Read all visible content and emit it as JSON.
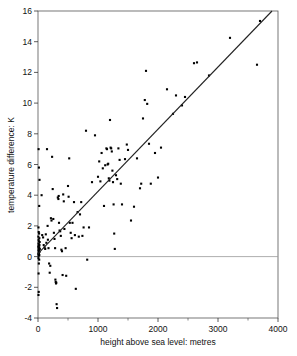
{
  "chart_data": {
    "type": "scatter",
    "title": "",
    "subtitle": "",
    "xlabel": "height above sea level: metres",
    "ylabel": "temperature difference: K",
    "xlim": [
      0,
      4000
    ],
    "ylim": [
      -4,
      16
    ],
    "xticks": [
      0,
      1000,
      2000,
      3000,
      4000
    ],
    "xtick_labels": [
      "0",
      "1000",
      "2000",
      "3000",
      "4000"
    ],
    "xminor_ticks": [
      500,
      1500,
      2500,
      3500
    ],
    "yticks": [
      -4,
      -2,
      0,
      2,
      4,
      6,
      8,
      10,
      12,
      14,
      16
    ],
    "ytick_labels": [
      "-4",
      "-2",
      "0",
      "2",
      "4",
      "6",
      "8",
      "10",
      "12",
      "14",
      "16"
    ],
    "grid": false,
    "zero_line": {
      "y": 0,
      "color": "#999999",
      "visible": true
    },
    "legend": null,
    "marker": {
      "shape": "square",
      "size": 2.1,
      "color": "#000000"
    },
    "trendline": {
      "type": "line",
      "color": "#222222",
      "x_start": 0,
      "y_start": 0.2,
      "x_end": 3900,
      "y_end": 16.0,
      "slope": 0.004051,
      "intercept": 0.2
    },
    "series": [
      {
        "name": "stations",
        "points": [
          [
            10,
            7.0
          ],
          [
            15,
            5.8
          ],
          [
            20,
            3.3
          ],
          [
            25,
            5.0
          ],
          [
            8,
            1.9
          ],
          [
            12,
            1.6
          ],
          [
            18,
            1.5
          ],
          [
            6,
            1.3
          ],
          [
            22,
            1.2
          ],
          [
            10,
            1.1
          ],
          [
            14,
            1.0
          ],
          [
            28,
            0.95
          ],
          [
            8,
            0.85
          ],
          [
            16,
            0.8
          ],
          [
            24,
            0.75
          ],
          [
            12,
            0.7
          ],
          [
            6,
            0.65
          ],
          [
            20,
            0.6
          ],
          [
            10,
            0.55
          ],
          [
            30,
            0.5
          ],
          [
            14,
            0.45
          ],
          [
            8,
            0.4
          ],
          [
            18,
            0.35
          ],
          [
            24,
            0.3
          ],
          [
            10,
            0.25
          ],
          [
            16,
            0.2
          ],
          [
            6,
            0.15
          ],
          [
            22,
            0.1
          ],
          [
            12,
            0.05
          ],
          [
            8,
            -0.1
          ],
          [
            20,
            -0.2
          ],
          [
            14,
            -0.45
          ],
          [
            10,
            -1.1
          ],
          [
            12,
            -2.3
          ],
          [
            8,
            -2.5
          ],
          [
            60,
            4.0
          ],
          [
            70,
            1.4
          ],
          [
            85,
            1.25
          ],
          [
            95,
            0.75
          ],
          [
            110,
            0.6
          ],
          [
            120,
            0.5
          ],
          [
            130,
            1.45
          ],
          [
            140,
            0.9
          ],
          [
            150,
            7.0
          ],
          [
            160,
            2.0
          ],
          [
            165,
            1.1
          ],
          [
            175,
            0.55
          ],
          [
            185,
            -0.45
          ],
          [
            195,
            -1.05
          ],
          [
            205,
            -0.6
          ],
          [
            215,
            2.5
          ],
          [
            225,
            2.35
          ],
          [
            235,
            6.5
          ],
          [
            245,
            4.4
          ],
          [
            255,
            2.45
          ],
          [
            265,
            1.55
          ],
          [
            275,
            1.15
          ],
          [
            285,
            0.55
          ],
          [
            290,
            -1.5
          ],
          [
            295,
            -1.65
          ],
          [
            300,
            -1.75
          ],
          [
            305,
            -1.7
          ],
          [
            310,
            -3.1
          ],
          [
            318,
            -3.35
          ],
          [
            330,
            3.85
          ],
          [
            340,
            3.75
          ],
          [
            345,
            3.95
          ],
          [
            350,
            2.2
          ],
          [
            360,
            1.7
          ],
          [
            370,
            1.65
          ],
          [
            380,
            1.35
          ],
          [
            390,
            0.45
          ],
          [
            400,
            0.35
          ],
          [
            410,
            -1.2
          ],
          [
            420,
            4.05
          ],
          [
            430,
            3.6
          ],
          [
            440,
            1.8
          ],
          [
            460,
            0.55
          ],
          [
            470,
            -1.25
          ],
          [
            500,
            4.6
          ],
          [
            510,
            3.9
          ],
          [
            520,
            6.4
          ],
          [
            530,
            2.2
          ],
          [
            545,
            1.55
          ],
          [
            560,
            1.2
          ],
          [
            575,
            2.2
          ],
          [
            600,
            3.55
          ],
          [
            615,
            1.4
          ],
          [
            630,
            -2.1
          ],
          [
            660,
            2.9
          ],
          [
            680,
            1.3
          ],
          [
            700,
            2.75
          ],
          [
            720,
            3.55
          ],
          [
            740,
            1.35
          ],
          [
            760,
            1.9
          ],
          [
            800,
            8.2
          ],
          [
            820,
            -0.2
          ],
          [
            850,
            1.9
          ],
          [
            900,
            4.85
          ],
          [
            950,
            7.9
          ],
          [
            1000,
            5.2
          ],
          [
            1020,
            6.2
          ],
          [
            1040,
            4.9
          ],
          [
            1060,
            6.75
          ],
          [
            1080,
            5.75
          ],
          [
            1100,
            3.3
          ],
          [
            1120,
            5.95
          ],
          [
            1140,
            7.05
          ],
          [
            1150,
            7.0
          ],
          [
            1160,
            6.0
          ],
          [
            1170,
            6.05
          ],
          [
            1180,
            5.1
          ],
          [
            1190,
            4.95
          ],
          [
            1200,
            8.9
          ],
          [
            1210,
            7.1
          ],
          [
            1220,
            7.05
          ],
          [
            1230,
            6.85
          ],
          [
            1240,
            5.6
          ],
          [
            1250,
            4.85
          ],
          [
            1260,
            3.4
          ],
          [
            1270,
            1.5
          ],
          [
            1280,
            0.5
          ],
          [
            1300,
            5.3
          ],
          [
            1320,
            5.05
          ],
          [
            1340,
            7.05
          ],
          [
            1360,
            6.3
          ],
          [
            1380,
            4.75
          ],
          [
            1400,
            3.4
          ],
          [
            1450,
            6.35
          ],
          [
            1480,
            7.3
          ],
          [
            1500,
            6.95
          ],
          [
            1550,
            2.35
          ],
          [
            1600,
            3.25
          ],
          [
            1650,
            6.4
          ],
          [
            1700,
            4.45
          ],
          [
            1720,
            4.75
          ],
          [
            1750,
            9.0
          ],
          [
            1780,
            10.2
          ],
          [
            1800,
            12.1
          ],
          [
            1820,
            9.95
          ],
          [
            1850,
            7.35
          ],
          [
            1880,
            4.75
          ],
          [
            1950,
            6.75
          ],
          [
            2000,
            5.15
          ],
          [
            2050,
            7.1
          ],
          [
            2150,
            10.9
          ],
          [
            2250,
            9.3
          ],
          [
            2300,
            10.5
          ],
          [
            2400,
            9.85
          ],
          [
            2450,
            10.4
          ],
          [
            2600,
            12.6
          ],
          [
            2650,
            12.65
          ],
          [
            2850,
            11.8
          ],
          [
            3200,
            14.25
          ],
          [
            3650,
            12.5
          ],
          [
            3700,
            15.35
          ]
        ]
      }
    ]
  },
  "axes": {
    "x_title": "height above sea level: metres",
    "y_title": "temperature difference: K"
  }
}
